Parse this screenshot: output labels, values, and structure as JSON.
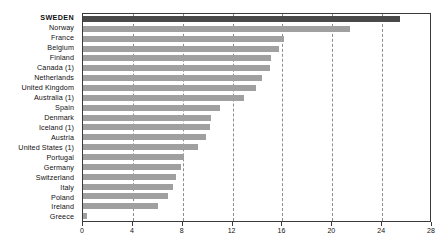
{
  "chart_data": {
    "type": "bar",
    "orientation": "horizontal",
    "title": "",
    "subtitle": "",
    "xlabel": "",
    "ylabel": "",
    "xlim": [
      0,
      28
    ],
    "ylim": null,
    "grid": true,
    "legend": null,
    "legend_position": "none",
    "xticks": [
      "0",
      "4",
      "8",
      "12",
      "16",
      "20",
      "24",
      "28"
    ],
    "xtick_values": [
      0,
      4,
      8,
      12,
      16,
      20,
      24,
      28
    ],
    "highlight_category": "SWEDEN",
    "colors": {
      "bar": "#a0a0a0",
      "bar_highlight": "#4a4a4a",
      "axis": "#3a3a3a",
      "gridline": "#8d8d8d",
      "background": "#ffffff",
      "text": "#111111"
    },
    "categories": [
      "SWEDEN",
      "Norway",
      "France",
      "Belgium",
      "Finland",
      "Canada (1)",
      "Netherlands",
      "United Kingdom",
      "Australia (1)",
      "Spain",
      "Denmark",
      "Iceland (1)",
      "Austria",
      "United States (1)",
      "Portugal",
      "Germany",
      "Switzerland",
      "Italy",
      "Poland",
      "Ireland",
      "Greece"
    ],
    "values": [
      25.4,
      21.4,
      16.1,
      15.7,
      15.1,
      15.0,
      14.4,
      13.9,
      12.9,
      11.0,
      10.3,
      10.2,
      9.9,
      9.2,
      8.1,
      7.9,
      7.5,
      7.2,
      6.8,
      6.0,
      0.35
    ]
  }
}
